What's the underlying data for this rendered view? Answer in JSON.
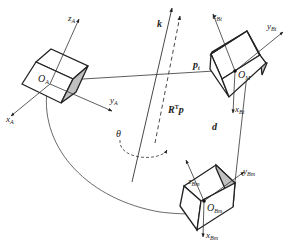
{
  "diagram": {
    "type": "coordinate-frame-transformation",
    "frames": {
      "A": {
        "origin": "O_A",
        "origin_label": "O",
        "origin_sub": "A",
        "axes": [
          {
            "name": "z",
            "sub": "A"
          },
          {
            "name": "y",
            "sub": "A"
          },
          {
            "name": "x",
            "sub": "A"
          }
        ]
      },
      "Bt": {
        "origin": "O_M",
        "origin_label": "O",
        "origin_sub": "M",
        "axes": [
          {
            "name": "z",
            "sub": "Bt"
          },
          {
            "name": "y",
            "sub": "Bt"
          },
          {
            "name": "x",
            "sub": "Bt"
          }
        ]
      },
      "Bm": {
        "origin": "O_Bm",
        "origin_label": "O",
        "origin_sub": "Bm",
        "axes": [
          {
            "name": "z",
            "sub": "Bm"
          },
          {
            "name": "y",
            "sub": "Bm"
          },
          {
            "name": "x",
            "sub": "Bm"
          }
        ]
      }
    },
    "vectors": {
      "k": "k",
      "rtp_main": "R",
      "rtp_sup": "T",
      "rtp_p": "p",
      "pt_main": "p",
      "pt_sub": "t",
      "d": "d"
    },
    "angle": "θ",
    "colors": {
      "line": "#333333",
      "box_shade": "#c0c0c0",
      "background": "#ffffff"
    }
  }
}
